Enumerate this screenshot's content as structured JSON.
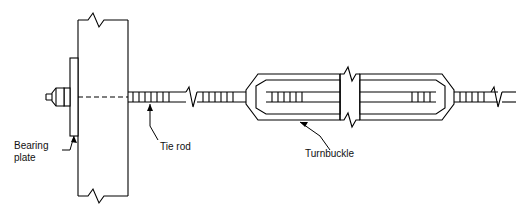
{
  "diagram": {
    "stroke_color": "#000000",
    "fill_color": "#ffffff",
    "background": "#ffffff",
    "labels": {
      "bearing_plate": "Bearing\nplate",
      "tie_rod": "Tie rod",
      "turnbuckle": "Turnbuckle"
    },
    "parts": [
      {
        "name": "masonry-wall",
        "note": "vertical wall section with break symbols top and bottom"
      },
      {
        "name": "bearing-plate",
        "note": "square plate with washer and hex nut at left face of wall"
      },
      {
        "name": "tie-rod",
        "note": "horizontal threaded rod passing through the wall"
      },
      {
        "name": "turnbuckle",
        "note": "elongated hexagonal body with open slot, threaded rod ends"
      },
      {
        "name": "break-symbol",
        "note": "zig-zag break marks on rod and wall"
      }
    ]
  }
}
